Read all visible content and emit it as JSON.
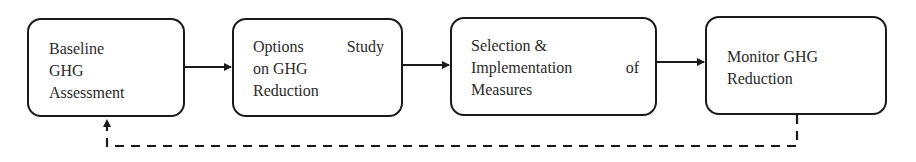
{
  "diagram": {
    "type": "flowchart",
    "direction": "left-to-right",
    "nodes": [
      {
        "id": "baseline",
        "lines": [
          "Baseline",
          "GHG",
          "Assessment"
        ]
      },
      {
        "id": "options",
        "lines": [
          "Options Study",
          "on GHG",
          "Reduction"
        ]
      },
      {
        "id": "selection",
        "lines": [
          "Selection &",
          "Implementation of",
          "Measures"
        ]
      },
      {
        "id": "monitor",
        "lines": [
          "Monitor GHG",
          "Reduction"
        ]
      }
    ],
    "edges": [
      {
        "from": "baseline",
        "to": "options",
        "style": "solid"
      },
      {
        "from": "options",
        "to": "selection",
        "style": "solid"
      },
      {
        "from": "selection",
        "to": "monitor",
        "style": "solid"
      },
      {
        "from": "monitor",
        "to": "baseline",
        "style": "dashed",
        "label": ""
      }
    ],
    "colors": {
      "stroke": "#1a1a1a",
      "text": "#2a2a2a",
      "background": "#ffffff"
    }
  },
  "text": {
    "n1": {
      "l1": "Baseline",
      "l2": "GHG",
      "l3": "Assessment"
    },
    "n2": {
      "l1a": "Options",
      "l1b": "Study",
      "l2": "on GHG",
      "l3": "Reduction"
    },
    "n3": {
      "l1": "Selection &",
      "l2a": "Implementation",
      "l2b": "of",
      "l3": "Measures"
    },
    "n4": {
      "l1": "Monitor GHG",
      "l2": "Reduction"
    }
  }
}
